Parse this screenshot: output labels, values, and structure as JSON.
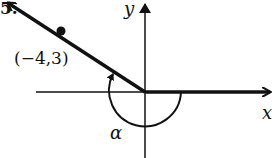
{
  "problem": {
    "number_label": "5."
  },
  "axes": {
    "x_label": "x",
    "y_label": "y"
  },
  "point": {
    "label": "(−4,3)",
    "x": -4,
    "y": 3
  },
  "angle": {
    "label": "α",
    "direction": "clockwise-negative",
    "description": "angle measured from positive x-axis to terminal ray through (-4,3)"
  },
  "colors": {
    "ink": "#111111",
    "background": "#ffffff"
  }
}
